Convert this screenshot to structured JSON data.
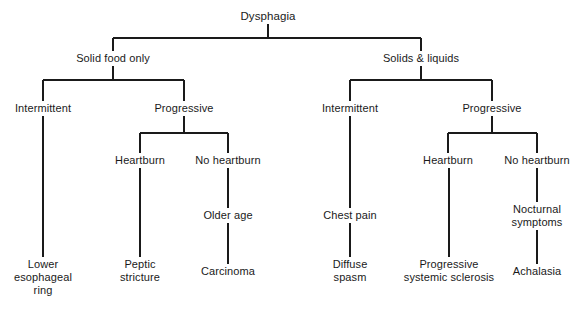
{
  "diagram": {
    "title": "Dysphagia",
    "type": "clinical-decision-tree",
    "background_color": "#ffffff",
    "line_color": "#1a1a1a",
    "text_color": "#1a1a1a",
    "nodes": [
      {
        "id": "root",
        "label": "Dysphagia",
        "x": 268,
        "y": 17,
        "level": 0
      },
      {
        "id": "solid-only",
        "label": "Solid food only",
        "x": 113,
        "y": 59,
        "level": 1
      },
      {
        "id": "solids-liquids",
        "label": "Solids & liquids",
        "x": 421,
        "y": 59,
        "level": 1
      },
      {
        "id": "left-intermittent",
        "label": "Intermittent",
        "x": 43,
        "y": 109,
        "level": 2
      },
      {
        "id": "left-progressive",
        "label": "Progressive",
        "x": 184,
        "y": 109,
        "level": 2
      },
      {
        "id": "right-intermittent",
        "label": "Intermittent",
        "x": 350,
        "y": 109,
        "level": 2
      },
      {
        "id": "right-progressive",
        "label": "Progressive",
        "x": 492,
        "y": 109,
        "level": 2
      },
      {
        "id": "left-heartburn",
        "label": "Heartburn",
        "x": 140,
        "y": 161,
        "level": 3
      },
      {
        "id": "left-no-heartburn",
        "label": "No heartburn",
        "x": 228,
        "y": 161,
        "level": 3
      },
      {
        "id": "right-heartburn",
        "label": "Heartburn",
        "x": 448,
        "y": 161,
        "level": 3
      },
      {
        "id": "right-no-heartburn",
        "label": "No heartburn",
        "x": 537,
        "y": 161,
        "level": 3
      },
      {
        "id": "older-age",
        "label": "Older age",
        "x": 228,
        "y": 216,
        "level": 4
      },
      {
        "id": "chest-pain",
        "label": "Chest pain",
        "x": 350,
        "y": 216,
        "level": 4
      },
      {
        "id": "nocturnal-symptoms",
        "label": "Nocturnal\nsymptoms",
        "x": 537,
        "y": 210,
        "level": 4
      },
      {
        "id": "lower-esophageal-ring",
        "label": "Lower\nesophageal\nring",
        "x": 43,
        "y": 265,
        "level": 5
      },
      {
        "id": "peptic-stricture",
        "label": "Peptic\nstricture",
        "x": 140,
        "y": 265,
        "level": 5
      },
      {
        "id": "carcinoma",
        "label": "Carcinoma",
        "x": 228,
        "y": 272,
        "level": 5
      },
      {
        "id": "diffuse-spasm",
        "label": "Diffuse\nspasm",
        "x": 350,
        "y": 265,
        "level": 5
      },
      {
        "id": "progressive-systemic-sclerosis",
        "label": "Progressive\nsystemic sclerosis",
        "x": 449,
        "y": 265,
        "level": 5
      },
      {
        "id": "achalasia",
        "label": "Achalasia",
        "x": 537,
        "y": 272,
        "level": 5
      }
    ],
    "edges": [
      {
        "from": "root",
        "to": "solid-only"
      },
      {
        "from": "root",
        "to": "solids-liquids"
      },
      {
        "from": "solid-only",
        "to": "left-intermittent"
      },
      {
        "from": "solid-only",
        "to": "left-progressive"
      },
      {
        "from": "solids-liquids",
        "to": "right-intermittent"
      },
      {
        "from": "solids-liquids",
        "to": "right-progressive"
      },
      {
        "from": "left-progressive",
        "to": "left-heartburn"
      },
      {
        "from": "left-progressive",
        "to": "left-no-heartburn"
      },
      {
        "from": "right-progressive",
        "to": "right-heartburn"
      },
      {
        "from": "right-progressive",
        "to": "right-no-heartburn"
      },
      {
        "from": "left-intermittent",
        "to": "lower-esophageal-ring"
      },
      {
        "from": "left-heartburn",
        "to": "peptic-stricture"
      },
      {
        "from": "left-no-heartburn",
        "to": "older-age"
      },
      {
        "from": "older-age",
        "to": "carcinoma"
      },
      {
        "from": "right-intermittent",
        "to": "chest-pain"
      },
      {
        "from": "chest-pain",
        "to": "diffuse-spasm"
      },
      {
        "from": "right-heartburn",
        "to": "progressive-systemic-sclerosis"
      },
      {
        "from": "right-no-heartburn",
        "to": "nocturnal-symptoms"
      },
      {
        "from": "nocturnal-symptoms",
        "to": "achalasia"
      }
    ]
  }
}
